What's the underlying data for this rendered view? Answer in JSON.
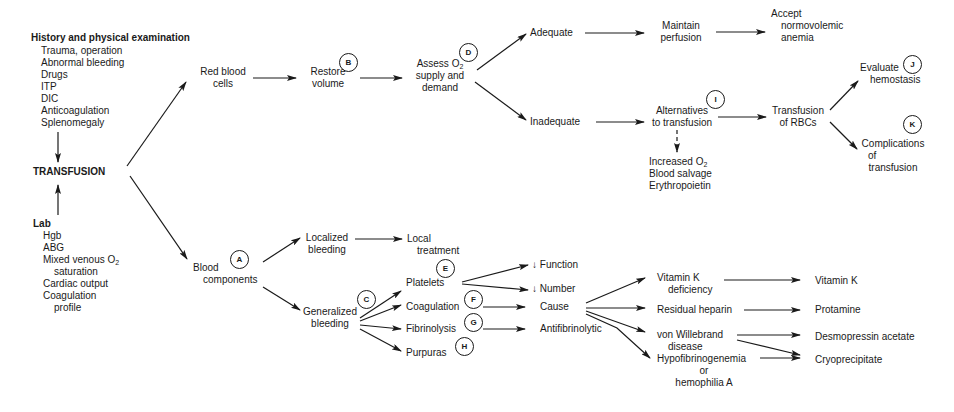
{
  "diagram": {
    "type": "flowchart",
    "history": {
      "heading": "History and physical examination",
      "items": [
        "Trauma, operation",
        "Abnormal bleeding",
        "Drugs",
        "ITP",
        "DIC",
        "Anticoagulation",
        "Splenomegaly"
      ]
    },
    "center": "TRANSFUSION",
    "lab": {
      "heading": "Lab",
      "items": [
        "Hgb",
        "ABG",
        "Mixed venous O2",
        "saturation",
        "Cardiac output",
        "Coagulation",
        "profile"
      ]
    },
    "rbc_branch": {
      "red_blood_cells": [
        "Red blood",
        "cells"
      ],
      "restore_volume": [
        "Restore",
        "volume"
      ],
      "assess": [
        "Assess O2",
        "supply and",
        "demand"
      ],
      "adequate": "Adequate",
      "maintain_perfusion": [
        "Maintain",
        "perfusion"
      ],
      "accept": [
        "Accept",
        "normovolemic",
        "anemia"
      ],
      "inadequate": "Inadequate",
      "alternatives": [
        "Alternatives",
        "to transfusion"
      ],
      "alt_options": [
        "Increased O2",
        "Blood salvage",
        "Erythropoietin"
      ],
      "transfusion_rbcs": [
        "Transfusion",
        "of RBCs"
      ],
      "evaluate": [
        "Evaluate",
        "hemostasis"
      ],
      "complications": [
        "Complications",
        "of",
        "transfusion"
      ]
    },
    "component_branch": {
      "blood_components": [
        "Blood",
        "components"
      ],
      "localized": [
        "Localized",
        "bleeding"
      ],
      "local_treatment": [
        "Local",
        "treatment"
      ],
      "generalized": [
        "Generalized",
        "bleeding"
      ],
      "platelets": "Platelets",
      "coagulation": "Coagulation",
      "fibrinolysis": "Fibrinolysis",
      "purpuras": "Purpuras",
      "function": "↓ Function",
      "number": "↓ Number",
      "cause": "Cause",
      "antifibrinolytic": "Antifibrinolytic",
      "vitk_def": [
        "Vitamin K",
        "deficiency"
      ],
      "residual_heparin": "Residual heparin",
      "vwd": [
        "von Willebrand",
        "disease"
      ],
      "hypofib": [
        "Hypofibrinogenemia",
        "or",
        "hemophilia A"
      ],
      "vitamin_k": "Vitamin K",
      "protamine": "Protamine",
      "desmopressin": "Desmopressin acetate",
      "cryo": "Cryoprecipitate"
    },
    "markers": [
      "A",
      "B",
      "C",
      "D",
      "E",
      "F",
      "G",
      "H",
      "I",
      "J",
      "K"
    ]
  }
}
